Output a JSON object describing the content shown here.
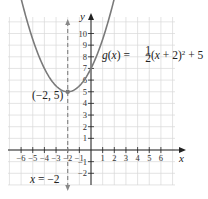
{
  "chart_data": {
    "type": "line",
    "title": "",
    "function_label": "g(x) = ½(x + 2)² + 5",
    "function": {
      "a": 0.5,
      "h": -2,
      "k": 5
    },
    "vertex": {
      "x": -2,
      "y": 5,
      "label": "(−2, 5)"
    },
    "axis_of_symmetry": {
      "x": -2,
      "label": "x = −2"
    },
    "xlabel": "x",
    "ylabel": "y",
    "xlim": [
      -7,
      7
    ],
    "ylim": [
      -3,
      11
    ],
    "x_ticks": [
      -6,
      -5,
      -4,
      -3,
      -2,
      -1,
      1,
      2,
      3,
      4,
      5,
      6
    ],
    "y_ticks": [
      -2,
      -1,
      1,
      2,
      3,
      4,
      5,
      6,
      7,
      8,
      9,
      10
    ],
    "grid": true,
    "series": [
      {
        "name": "g(x)",
        "x": [
          -6.5,
          -6,
          -5,
          -4,
          -3,
          -2,
          -1,
          0,
          1,
          2,
          2.5
        ],
        "y": [
          15.125,
          13,
          9.5,
          7,
          5.5,
          5,
          5.5,
          7,
          9.5,
          13,
          15.125
        ]
      }
    ],
    "colors": {
      "curve": "#7a7a7a",
      "axis": "#222222",
      "grid": "#d9d9d9",
      "dashed": "#888888"
    }
  }
}
